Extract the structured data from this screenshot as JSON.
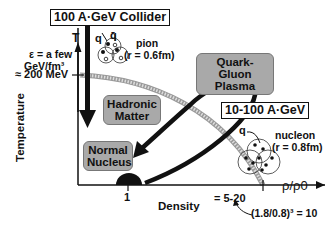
{
  "title_box": "100 A·GeV Collider",
  "mid_box": "10-100 A·GeV",
  "axes": {
    "y_symbol": "T",
    "y_label": "Temperature",
    "x_label": "Density",
    "x_symbol": "ρ/ρ0",
    "x_tick_1": "1",
    "x_tick_2": "= 5-20"
  },
  "annotations": {
    "energy_line1": "ε = a few",
    "energy_line2": "GeV/fm³",
    "temp_mark": "≈ 200 MeV",
    "pion_q": "q",
    "pion_qbar": "q̄",
    "pion_label": "pion",
    "pion_radius": "(r = 0.6fm)",
    "nucleon_q": "q",
    "nucleon_label": "nucleon",
    "nucleon_radius": "(r = 0.8fm)",
    "ratio_formula": "(1.8/0.8)³  = 10"
  },
  "regions": {
    "qgp_line1": "Quark-Gluon",
    "qgp_line2": "Plasma",
    "hadronic_line1": "Hadronic",
    "hadronic_line2": "Matter",
    "nucleus_line1": "Normal",
    "nucleus_line2": "Nucleus"
  },
  "colors": {
    "region_fill": "#a9a9a9",
    "boundary": "#bdbdbd",
    "ink": "#111111"
  }
}
